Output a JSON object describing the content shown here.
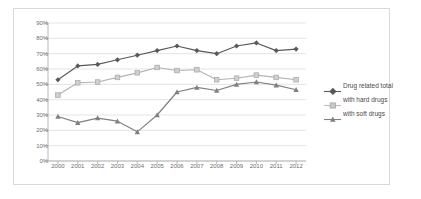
{
  "chart_data": {
    "type": "line",
    "title": "",
    "subtitle": "",
    "xlabel": "",
    "ylabel": "",
    "categories": [
      "2000",
      "2001",
      "2002",
      "2003",
      "2004",
      "2005",
      "2006",
      "2007",
      "2008",
      "2009",
      "2010",
      "2011",
      "2012"
    ],
    "ytick_labels": [
      "0%",
      "10%",
      "20%",
      "30%",
      "40%",
      "50%",
      "60%",
      "70%",
      "80%",
      "90%"
    ],
    "ytick_values": [
      0,
      10,
      20,
      30,
      40,
      50,
      60,
      70,
      80,
      90
    ],
    "ylim": [
      0,
      90
    ],
    "grid": "horizontal",
    "legend_position": "right",
    "series": [
      {
        "name": "Drug related total",
        "color": "#595959",
        "marker": "diamond",
        "values": [
          53,
          62,
          63,
          66,
          69,
          72,
          75,
          72,
          70,
          75,
          77,
          72,
          73
        ]
      },
      {
        "name": "with hard drugs",
        "color": "#b3b3b3",
        "marker": "square",
        "values": [
          43,
          51,
          51.5,
          54.5,
          57.5,
          61,
          59,
          59.5,
          53,
          54,
          56,
          54.5,
          53
        ]
      },
      {
        "name": "with soft drugs",
        "color": "#808080",
        "marker": "triangle",
        "values": [
          29,
          25,
          28,
          26,
          19,
          30,
          45,
          48,
          46,
          50,
          51.5,
          49.5,
          46.5
        ]
      }
    ]
  },
  "legend": {
    "entries": [
      {
        "label": "Drug related total"
      },
      {
        "label": "with hard drugs"
      },
      {
        "label": "with soft drugs"
      }
    ]
  }
}
